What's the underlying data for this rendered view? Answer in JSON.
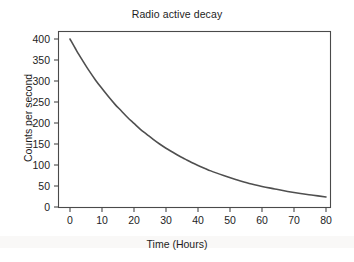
{
  "chart_data": {
    "type": "line",
    "title": "Radio active decay",
    "xlabel": "Time (Hours)",
    "ylabel": "Counts per second",
    "xlim": [
      -3,
      84
    ],
    "ylim": [
      0,
      415
    ],
    "grid": false,
    "legend": "none",
    "xticks": [
      "0",
      "10",
      "20",
      "30",
      "40",
      "50",
      "60",
      "70",
      "80"
    ],
    "xtick_values": [
      0,
      10,
      20,
      30,
      40,
      50,
      60,
      70,
      80
    ],
    "yticks": [
      "0",
      "50",
      "100",
      "150",
      "200",
      "250",
      "300",
      "350",
      "400"
    ],
    "ytick_values": [
      0,
      50,
      100,
      150,
      200,
      250,
      300,
      350,
      400
    ],
    "series": [
      {
        "name": "Counts per second",
        "color": "#4f4f4f",
        "x": [
          0,
          2,
          4,
          6,
          8,
          10,
          12,
          14,
          16,
          18,
          20,
          22,
          24,
          26,
          28,
          30,
          32,
          34,
          36,
          38,
          40,
          44,
          48,
          52,
          56,
          60,
          64,
          68,
          72,
          76,
          80
        ],
        "values": [
          400,
          373,
          348,
          324,
          302,
          282,
          263,
          245,
          229,
          213,
          199,
          185,
          173,
          161,
          150,
          140,
          131,
          122,
          114,
          106,
          99,
          86,
          75,
          65,
          56,
          49,
          43,
          37,
          32,
          28,
          24
        ]
      }
    ],
    "annotations": []
  },
  "figure": {
    "title": "Radio active decay",
    "axis_x_label": "Time (Hours)",
    "axis_y_label": "Counts per second",
    "background_color": "#ffffff",
    "frame_color": "#4a4a4a",
    "curve_color": "#4f4f4f"
  }
}
